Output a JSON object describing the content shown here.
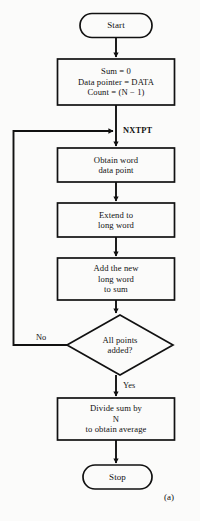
{
  "figure": {
    "caption": "(a)",
    "background_color": "#fbfbfa",
    "ink_color": "#111111"
  },
  "nodes": {
    "start": {
      "label": "Start",
      "shape": "terminator"
    },
    "init": {
      "shape": "process",
      "lines": [
        "Sum = 0",
        "Data pointer = DATA",
        "Count = (N − 1)"
      ]
    },
    "obtain": {
      "shape": "process",
      "lines": [
        "Obtain word",
        "data point"
      ]
    },
    "extend": {
      "shape": "process",
      "lines": [
        "Extend to",
        "long word"
      ]
    },
    "accumulate": {
      "shape": "process",
      "lines": [
        "Add the new",
        "long word",
        "to sum"
      ]
    },
    "decision": {
      "shape": "decision",
      "lines": [
        "All points",
        "added?"
      ]
    },
    "divide": {
      "shape": "process",
      "lines": [
        "Divide sum by",
        "N",
        "to obtain average"
      ]
    },
    "stop": {
      "label": "Stop",
      "shape": "terminator"
    }
  },
  "edge_labels": {
    "loop_target": "NXTPT",
    "no_branch": "No",
    "yes_branch": "Yes"
  }
}
